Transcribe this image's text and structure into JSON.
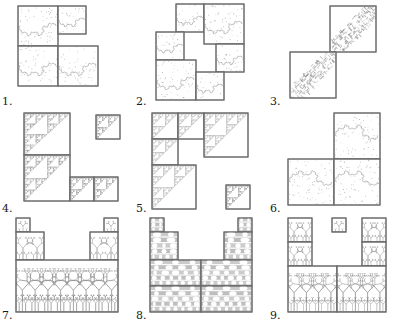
{
  "figure": {
    "title": "",
    "kind": "fractal-tiling-grid",
    "grid": {
      "rows": 3,
      "cols": 3
    },
    "background_color": "#ffffff",
    "outline_color": "#6b6b6b",
    "fractal_color": "#8c8c8c",
    "label_color": "#1a1a1a"
  },
  "panels": [
    {
      "label": "1.",
      "fractal": "twindragon-square",
      "tiles": [
        {
          "x": 18,
          "y": 6,
          "w": 40,
          "h": 40,
          "seed": 11,
          "level": 6,
          "kind": "dragon"
        },
        {
          "x": 58,
          "y": 6,
          "w": 28,
          "h": 28,
          "seed": 12,
          "level": 5,
          "kind": "dragon"
        },
        {
          "x": 18,
          "y": 46,
          "w": 40,
          "h": 40,
          "seed": 13,
          "level": 6,
          "kind": "dragon"
        },
        {
          "x": 58,
          "y": 46,
          "w": 40,
          "h": 40,
          "seed": 14,
          "level": 6,
          "kind": "dragon"
        }
      ]
    },
    {
      "label": "2.",
      "fractal": "twindragon-square",
      "tiles": [
        {
          "x": 42,
          "y": 4,
          "w": 28,
          "h": 28,
          "seed": 21,
          "level": 5,
          "kind": "dragon"
        },
        {
          "x": 70,
          "y": 4,
          "w": 40,
          "h": 40,
          "seed": 22,
          "level": 6,
          "kind": "dragon"
        },
        {
          "x": 22,
          "y": 32,
          "w": 28,
          "h": 28,
          "seed": 23,
          "level": 5,
          "kind": "dragon"
        },
        {
          "x": 22,
          "y": 60,
          "w": 40,
          "h": 40,
          "seed": 24,
          "level": 6,
          "kind": "dragon"
        },
        {
          "x": 82,
          "y": 44,
          "w": 28,
          "h": 28,
          "seed": 25,
          "level": 5,
          "kind": "dragon"
        },
        {
          "x": 62,
          "y": 72,
          "w": 28,
          "h": 28,
          "seed": 26,
          "level": 5,
          "kind": "dragon"
        }
      ]
    },
    {
      "label": "3.",
      "fractal": "diagonal-arrowhead",
      "tiles": [
        {
          "x": 62,
          "y": 6,
          "w": 46,
          "h": 46,
          "seed": 31,
          "level": 4,
          "kind": "diag"
        },
        {
          "x": 22,
          "y": 52,
          "w": 46,
          "h": 46,
          "seed": 32,
          "level": 4,
          "kind": "diag"
        }
      ]
    },
    {
      "label": "4.",
      "fractal": "sierpinski-corner",
      "tiles": [
        {
          "x": 24,
          "y": 6,
          "w": 46,
          "h": 42,
          "seed": 41,
          "level": 5,
          "kind": "sier"
        },
        {
          "x": 96,
          "y": 8,
          "w": 24,
          "h": 24,
          "seed": 42,
          "level": 4,
          "kind": "sier"
        },
        {
          "x": 24,
          "y": 48,
          "w": 46,
          "h": 46,
          "seed": 43,
          "level": 5,
          "kind": "sier"
        },
        {
          "x": 70,
          "y": 70,
          "w": 24,
          "h": 24,
          "seed": 44,
          "level": 4,
          "kind": "sier"
        },
        {
          "x": 94,
          "y": 70,
          "w": 24,
          "h": 24,
          "seed": 45,
          "level": 4,
          "kind": "sier"
        }
      ]
    },
    {
      "label": "5.",
      "fractal": "sierpinski-corner",
      "tiles": [
        {
          "x": 18,
          "y": 6,
          "w": 26,
          "h": 26,
          "seed": 51,
          "level": 5,
          "kind": "sier"
        },
        {
          "x": 44,
          "y": 6,
          "w": 26,
          "h": 26,
          "seed": 52,
          "level": 5,
          "kind": "sier"
        },
        {
          "x": 70,
          "y": 6,
          "w": 44,
          "h": 44,
          "seed": 53,
          "level": 6,
          "kind": "sier"
        },
        {
          "x": 18,
          "y": 32,
          "w": 26,
          "h": 26,
          "seed": 54,
          "level": 5,
          "kind": "sier"
        },
        {
          "x": 18,
          "y": 58,
          "w": 44,
          "h": 44,
          "seed": 55,
          "level": 6,
          "kind": "sier"
        },
        {
          "x": 92,
          "y": 78,
          "w": 24,
          "h": 24,
          "seed": 56,
          "level": 4,
          "kind": "sier"
        }
      ]
    },
    {
      "label": "6.",
      "fractal": "terdragon-square",
      "tiles": [
        {
          "x": 66,
          "y": 6,
          "w": 46,
          "h": 46,
          "seed": 61,
          "level": 6,
          "kind": "dragon2"
        },
        {
          "x": 20,
          "y": 52,
          "w": 46,
          "h": 46,
          "seed": 62,
          "level": 6,
          "kind": "dragon2"
        },
        {
          "x": 66,
          "y": 52,
          "w": 46,
          "h": 46,
          "seed": 63,
          "level": 6,
          "kind": "dragon2"
        }
      ]
    },
    {
      "label": "7.",
      "fractal": "binary-tree-canopy",
      "tiles": [
        {
          "x": 16,
          "y": 4,
          "w": 14,
          "h": 14,
          "seed": 71,
          "level": 4,
          "kind": "tree"
        },
        {
          "x": 104,
          "y": 4,
          "w": 14,
          "h": 14,
          "seed": 72,
          "level": 4,
          "kind": "tree"
        },
        {
          "x": 16,
          "y": 18,
          "w": 28,
          "h": 28,
          "seed": 73,
          "level": 5,
          "kind": "tree"
        },
        {
          "x": 90,
          "y": 18,
          "w": 28,
          "h": 28,
          "seed": 74,
          "level": 5,
          "kind": "tree"
        },
        {
          "x": 16,
          "y": 46,
          "w": 102,
          "h": 52,
          "seed": 75,
          "level": 7,
          "kind": "tree"
        }
      ]
    },
    {
      "label": "8.",
      "fractal": "cantor-bar-canopy",
      "tiles": [
        {
          "x": 16,
          "y": 4,
          "w": 14,
          "h": 14,
          "seed": 81,
          "level": 4,
          "kind": "bars"
        },
        {
          "x": 104,
          "y": 4,
          "w": 14,
          "h": 14,
          "seed": 82,
          "level": 4,
          "kind": "bars"
        },
        {
          "x": 16,
          "y": 18,
          "w": 28,
          "h": 28,
          "seed": 83,
          "level": 5,
          "kind": "bars"
        },
        {
          "x": 90,
          "y": 18,
          "w": 28,
          "h": 28,
          "seed": 84,
          "level": 5,
          "kind": "bars"
        },
        {
          "x": 16,
          "y": 46,
          "w": 51,
          "h": 26,
          "seed": 85,
          "level": 5,
          "kind": "bars"
        },
        {
          "x": 67,
          "y": 46,
          "w": 51,
          "h": 26,
          "seed": 86,
          "level": 5,
          "kind": "bars"
        },
        {
          "x": 16,
          "y": 72,
          "w": 51,
          "h": 26,
          "seed": 87,
          "level": 5,
          "kind": "bars"
        },
        {
          "x": 67,
          "y": 72,
          "w": 51,
          "h": 26,
          "seed": 88,
          "level": 5,
          "kind": "bars"
        }
      ]
    },
    {
      "label": "9.",
      "fractal": "binary-tree-columns",
      "tiles": [
        {
          "x": 20,
          "y": 4,
          "w": 24,
          "h": 24,
          "seed": 91,
          "level": 5,
          "kind": "tree"
        },
        {
          "x": 64,
          "y": 4,
          "w": 14,
          "h": 14,
          "seed": 92,
          "level": 4,
          "kind": "tree"
        },
        {
          "x": 94,
          "y": 4,
          "w": 24,
          "h": 24,
          "seed": 93,
          "level": 5,
          "kind": "tree"
        },
        {
          "x": 20,
          "y": 28,
          "w": 24,
          "h": 24,
          "seed": 94,
          "level": 5,
          "kind": "tree"
        },
        {
          "x": 94,
          "y": 28,
          "w": 24,
          "h": 24,
          "seed": 95,
          "level": 5,
          "kind": "tree"
        },
        {
          "x": 20,
          "y": 52,
          "w": 49,
          "h": 46,
          "seed": 96,
          "level": 6,
          "kind": "tree"
        },
        {
          "x": 69,
          "y": 52,
          "w": 49,
          "h": 46,
          "seed": 97,
          "level": 6,
          "kind": "tree"
        }
      ]
    }
  ]
}
